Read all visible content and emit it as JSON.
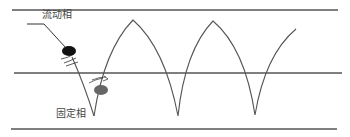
{
  "diagram": {
    "labels": {
      "mobile_phase": "流动相",
      "stationary_phase": "固定相"
    },
    "colors": {
      "line": "#555555",
      "curve": "#555555",
      "mobile_particle": "#111111",
      "stationary_particle": "#666666",
      "background": "#ffffff"
    },
    "horizontal_lines_y": [
      10,
      73,
      129
    ],
    "wave": {
      "description": "zigzag path of particle alternating between mobile and stationary phases",
      "peaks": [
        [
          133,
          20
        ],
        [
          213,
          21
        ]
      ],
      "troughs": [
        [
          94,
          116
        ],
        [
          178,
          116
        ],
        [
          255,
          115
        ]
      ],
      "end_point": [
        296,
        29
      ]
    },
    "particles": [
      {
        "name": "mobile-phase-particle",
        "cx": 69,
        "cy": 51,
        "rx": 7,
        "ry": 5
      },
      {
        "name": "stationary-phase-particle",
        "cx": 101,
        "cy": 90,
        "rx": 7,
        "ry": 5
      }
    ]
  }
}
